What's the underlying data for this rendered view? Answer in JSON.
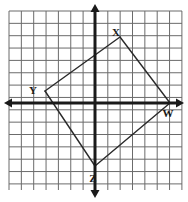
{
  "figure": {
    "background_color": "#ffffff",
    "grid": {
      "line_color": "#6b6b6b",
      "line_width": 1,
      "cell_size_px": 12.35,
      "columns": 14,
      "rows": 14.5,
      "left_px": 9,
      "top_px": 11,
      "right_px": 182,
      "bottom_px": 190
    },
    "axes": {
      "color": "#1a1a1a",
      "line_width": 3,
      "arrowheads": true,
      "x_axis_y_px": 103,
      "y_axis_x_px": 95,
      "x_axis_label": "",
      "y_axis_label": "",
      "tick_labels": []
    },
    "shape": {
      "name": "quadrilateral",
      "stroke_color": "#2a2a2a",
      "stroke_width": 1.4,
      "fill": "none",
      "vertices": [
        {
          "label": "X",
          "x_px": 120,
          "y_px": 37,
          "grid_x": 2,
          "grid_y": 5,
          "label_x_px": 116,
          "label_y_px": 33
        },
        {
          "label": "W",
          "x_px": 170,
          "y_px": 103,
          "grid_x": 6,
          "grid_y": 0,
          "label_x_px": 168,
          "label_y_px": 114
        },
        {
          "label": "Z",
          "x_px": 95,
          "y_px": 166,
          "grid_x": 0,
          "grid_y": -5,
          "label_x_px": 93,
          "label_y_px": 179
        },
        {
          "label": "Y",
          "x_px": 45,
          "y_px": 91,
          "grid_x": -4,
          "grid_y": 1,
          "label_x_px": 33,
          "label_y_px": 91
        }
      ],
      "edges": [
        {
          "from": "X",
          "to": "W"
        },
        {
          "from": "W",
          "to": "Z"
        },
        {
          "from": "Z",
          "to": "Y"
        },
        {
          "from": "Y",
          "to": "X"
        }
      ]
    }
  }
}
